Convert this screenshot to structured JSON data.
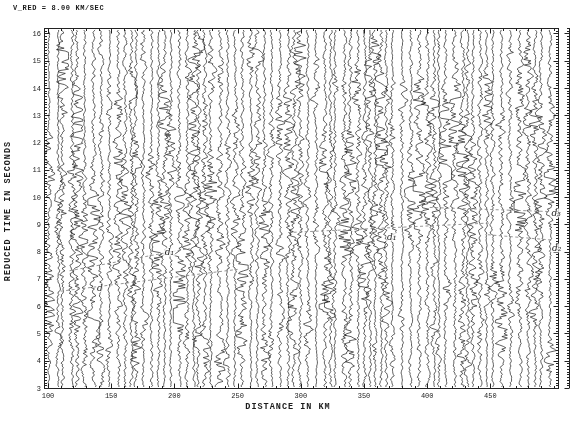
{
  "title": "V_RED = 8.00 KM/SEC",
  "chart_data": {
    "type": "line",
    "subtype": "seismic-record-section-wiggle-traces",
    "title": "V_RED = 8.00 KM/SEC",
    "reduction_velocity_km_s": 8.0,
    "xlabel": "DISTANCE IN KM",
    "ylabel": "REDUCED TIME IN SECONDS",
    "xlim": [
      96.8,
      503.5
    ],
    "ylim": [
      3,
      16.2
    ],
    "x_major_ticks": [
      100,
      150,
      200,
      250,
      300,
      350,
      400,
      450
    ],
    "x_minor_step_km": 10,
    "y_major_ticks": [
      3,
      4,
      5,
      6,
      7,
      8,
      9,
      10,
      11,
      12,
      13,
      14,
      15,
      16
    ],
    "y_minor_step_s": 0.1,
    "grid": false,
    "frame": "box-with-inward-ticks-all-sides",
    "ink_color": "#1b1b1b",
    "phase_line_color": "#8a8a8a",
    "traces": {
      "count_approx": 74,
      "start_km": 100.5,
      "end_km": 500,
      "min_spacing_km": 3.2,
      "spacing_jitter_km": 4.6,
      "seed": 9,
      "base_amp_px": 1.05,
      "arrival_band": {
        "t0_at_100km_s": 6.6,
        "slope_s_per_km": 0.006,
        "width_s": 4.5,
        "extra_amp": 0.85
      }
    },
    "annotations": [
      {
        "label": "d",
        "x_km": 141,
        "t_s": 6.68,
        "line": [
          [
            110,
            6.55
          ],
          [
            250,
            7.35
          ]
        ]
      },
      {
        "label": "d₁",
        "x_km": 196,
        "t_s": 8.0,
        "line": [
          [
            117,
            7.3
          ],
          [
            212,
            8.12
          ]
        ]
      },
      {
        "label": "d₁",
        "x_km": 372,
        "t_s": 8.53,
        "line": [
          [
            290,
            8.7
          ],
          [
            450,
            9.05
          ]
        ]
      },
      {
        "label": "d₂",
        "x_km": 502.5,
        "t_s": 8.15,
        "line": [
          [
            448,
            8.62
          ],
          [
            500,
            8.42
          ]
        ]
      },
      {
        "label": "d₃",
        "x_km": 502,
        "t_s": 9.41,
        "line": [
          [
            402,
            9.62
          ],
          [
            497,
            9.47
          ]
        ]
      }
    ]
  }
}
